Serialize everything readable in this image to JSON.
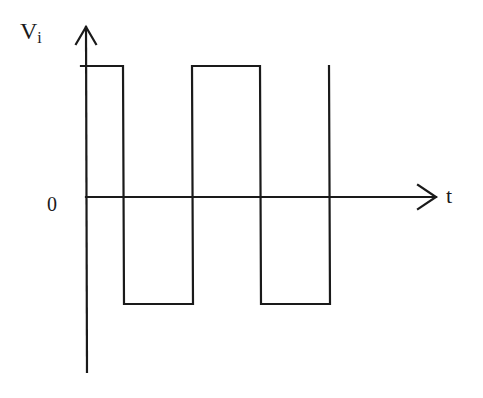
{
  "diagram": {
    "title": "",
    "y_axis_label": "V",
    "y_axis_subscript": "i",
    "x_axis_label": "t",
    "origin_label": "0",
    "stroke_color": "#1a1a1a",
    "background": "#ffffff",
    "waveform": {
      "type": "square-wave",
      "levels": [
        "high",
        "low"
      ],
      "segments": [
        {
          "level": "high",
          "from": "start",
          "to": "t1"
        },
        {
          "level": "low",
          "from": "t1",
          "to": "t2"
        },
        {
          "level": "high",
          "from": "t2",
          "to": "t3"
        },
        {
          "level": "low",
          "from": "t3",
          "to": "t4"
        }
      ]
    }
  }
}
